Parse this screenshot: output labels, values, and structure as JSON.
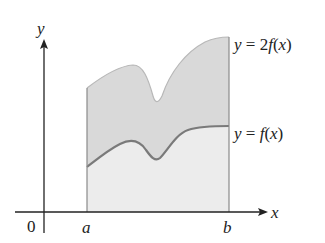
{
  "diagram": {
    "axes": {
      "x_label": "x",
      "y_label": "y",
      "origin_label": "0",
      "color": "#222222"
    },
    "bounds": {
      "a_label": "a",
      "b_label": "b"
    },
    "curves": [
      {
        "id": "2f",
        "label_prefix": "y = 2",
        "label_func": "f",
        "label_arg": "(x)",
        "label": "y = 2f(x)",
        "stroke": "#b8b8b8"
      },
      {
        "id": "f",
        "label_prefix": "y = ",
        "label_func": "f",
        "label_arg": "(x)",
        "label": "y = f(x)",
        "stroke": "#7a7a7a"
      }
    ],
    "regions": {
      "upper_fill": "#d9d9d9",
      "lower_fill": "#ececec",
      "boundary_stroke": "#8a8a8a"
    }
  }
}
